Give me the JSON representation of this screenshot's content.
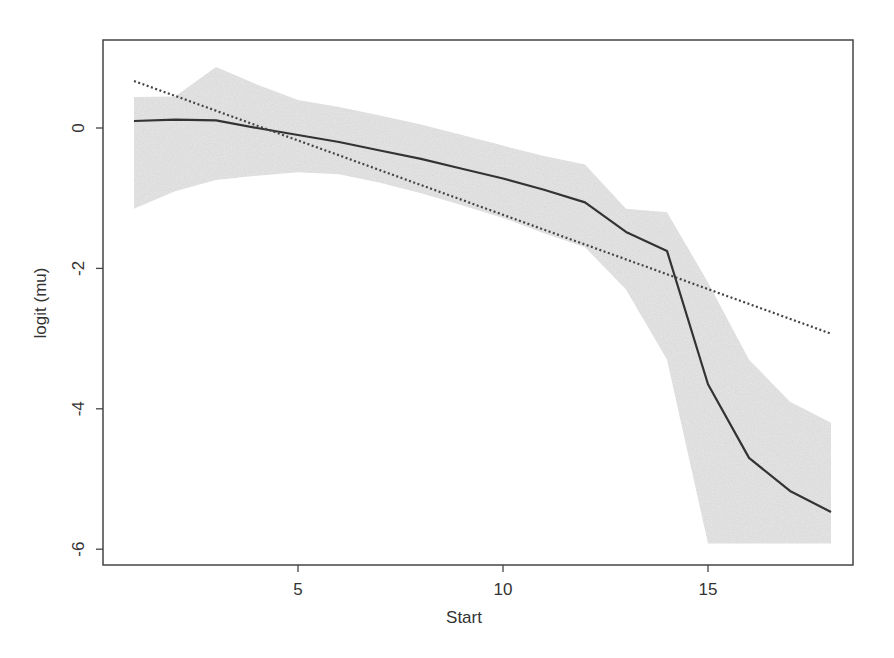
{
  "chart_data": {
    "type": "line",
    "title": "",
    "xlabel": "Start",
    "ylabel": "logit (mu)",
    "xlim": [
      0.5,
      18.5
    ],
    "ylim": [
      -6.3,
      1.3
    ],
    "x_ticks": [
      5,
      10,
      15
    ],
    "y_ticks": [
      0,
      -2,
      -4,
      -6
    ],
    "grid": false,
    "legend": "none",
    "series": [
      {
        "name": "smooth fit",
        "style": "solid",
        "color": "#333333",
        "x": [
          1,
          2,
          3,
          4,
          5,
          6,
          7,
          8,
          9,
          10,
          11,
          12,
          13,
          14,
          15,
          16,
          17,
          18
        ],
        "values": [
          0.1,
          0.12,
          0.11,
          0.0,
          -0.1,
          -0.2,
          -0.32,
          -0.44,
          -0.58,
          -0.72,
          -0.88,
          -1.06,
          -1.48,
          -1.75,
          -3.65,
          -4.7,
          -5.17,
          -5.47
        ]
      },
      {
        "name": "linear fit",
        "style": "dotted",
        "color": "#444444",
        "x": [
          1,
          18
        ],
        "values": [
          0.67,
          -2.93
        ]
      }
    ],
    "band": {
      "name": "confidence band",
      "color": "#d9d9d9",
      "x": [
        1,
        2,
        3,
        4,
        5,
        6,
        7,
        8,
        9,
        10,
        11,
        12,
        13,
        14,
        15,
        16,
        17,
        18
      ],
      "upper": [
        0.44,
        0.45,
        0.87,
        0.62,
        0.4,
        0.3,
        0.18,
        0.05,
        -0.1,
        -0.25,
        -0.4,
        -0.52,
        -1.15,
        -1.2,
        -2.2,
        -3.3,
        -3.9,
        -4.2
      ],
      "lower": [
        -1.15,
        -0.9,
        -0.74,
        -0.68,
        -0.63,
        -0.66,
        -0.78,
        -0.93,
        -1.1,
        -1.28,
        -1.5,
        -1.7,
        -2.3,
        -3.3,
        -5.92,
        -5.92,
        -5.92,
        -5.92
      ]
    }
  },
  "axes": {
    "x_title": "Start",
    "y_title": "logit (mu)",
    "x_tick_labels": [
      "5",
      "10",
      "15"
    ],
    "y_tick_labels": [
      "0",
      "-2",
      "-4",
      "-6"
    ]
  }
}
